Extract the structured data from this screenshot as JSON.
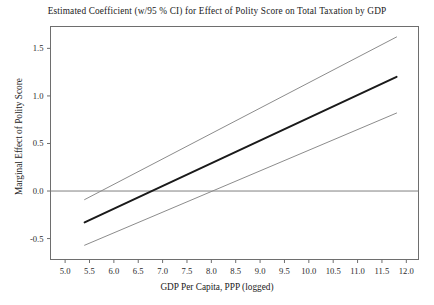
{
  "chart_data": {
    "type": "line",
    "title": "Estimated Coefficient (w/95 % CI) for Effect of Polity Score on Total Taxation by GDP",
    "xlabel": "GDP Per Capita, PPP (logged)",
    "ylabel": "Marginal Effect of Polity Score",
    "xlim": [
      4.7,
      12.25
    ],
    "ylim": [
      -0.72,
      1.73
    ],
    "xticks": [
      5.0,
      5.5,
      6.0,
      6.5,
      7.0,
      7.5,
      8.0,
      8.5,
      9.0,
      9.5,
      10.0,
      10.5,
      11.0,
      11.5,
      12.0
    ],
    "xticklabels": [
      "5.0",
      "5.5",
      "6.0",
      "6.5",
      "7.0",
      "7.5",
      "8.0",
      "8.5",
      "9.0",
      "9.5",
      "10.0",
      "10.5",
      "11.0",
      "11.5",
      "12.0"
    ],
    "yticks": [
      -0.5,
      0.0,
      0.5,
      1.0,
      1.5
    ],
    "yticklabels": [
      "-0.5",
      "0.0",
      "0.5",
      "1.0",
      "1.5"
    ],
    "grid": false,
    "legend": "none",
    "reference_lines": [
      {
        "name": "zero-line",
        "orientation": "horizontal",
        "y": 0.0,
        "color": "#808080"
      }
    ],
    "series": [
      {
        "name": "upper-ci",
        "label": "Upper 95% CI",
        "color": "#8c8c8c",
        "width": 1.0,
        "x": [
          5.4,
          11.8
        ],
        "values": [
          -0.09,
          1.62
        ]
      },
      {
        "name": "marginal-effect",
        "label": "Marginal Effect of Polity Score",
        "color": "#1a1a1a",
        "width": 2.0,
        "x": [
          5.4,
          11.8
        ],
        "values": [
          -0.33,
          1.2
        ]
      },
      {
        "name": "lower-ci",
        "label": "Lower 95% CI",
        "color": "#8c8c8c",
        "width": 1.0,
        "x": [
          5.4,
          11.8
        ],
        "values": [
          -0.57,
          0.82
        ]
      }
    ],
    "zero_crossings": {
      "marginal-effect": 6.78,
      "upper-ci": 5.74,
      "lower-ci": 7.76
    },
    "colors": {
      "estimate": "#1a1a1a",
      "confidence_interval": "#8c8c8c",
      "zero_reference": "#808080",
      "axis_frame": "#6e6e6e",
      "background": "#ffffff"
    }
  }
}
